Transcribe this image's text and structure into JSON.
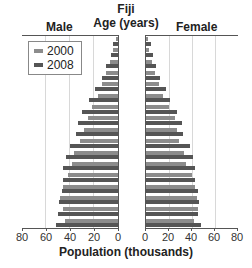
{
  "chart_data": {
    "type": "bar",
    "subtype": "population-pyramid",
    "title": "Fiji",
    "subtitle": "Age (years)",
    "left_label": "Male",
    "right_label": "Female",
    "xlabel": "Population (thousands)",
    "ylabel": "Age (years)",
    "xlim": [
      0,
      80
    ],
    "x_ticks_left": [
      "80",
      "60",
      "40",
      "20",
      "0"
    ],
    "x_ticks_right": [
      "0",
      "20",
      "40",
      "60",
      "80"
    ],
    "grid": true,
    "legend_position": "upper-left",
    "categories": [
      "0-4",
      "5-9",
      "10-14",
      "15-19",
      "20-24",
      "25-29",
      "30-34",
      "35-39",
      "40-44",
      "45-49",
      "50-54",
      "55-59",
      "60-64",
      "65-69",
      "70-74",
      "75-79",
      "80+"
    ],
    "series": [
      {
        "name": "2000",
        "side": "male",
        "color": "#8c8c8c",
        "values": [
          44,
          46,
          48,
          46,
          42,
          38,
          37,
          32,
          28,
          25,
          22,
          17,
          13,
          10,
          7,
          4,
          2
        ]
      },
      {
        "name": "2008",
        "side": "male",
        "color": "#555555",
        "values": [
          52,
          50,
          49,
          47,
          46,
          46,
          43,
          40,
          35,
          33,
          30,
          24,
          19,
          13,
          10,
          6,
          4
        ]
      },
      {
        "name": "2000",
        "side": "female",
        "color": "#8c8c8c",
        "values": [
          42,
          45,
          44,
          43,
          40,
          35,
          33,
          29,
          27,
          25,
          20,
          15,
          11,
          8,
          5,
          3,
          2
        ]
      },
      {
        "name": "2008",
        "side": "female",
        "color": "#555555",
        "values": [
          48,
          45,
          46,
          45,
          43,
          43,
          41,
          38,
          32,
          31,
          27,
          21,
          17,
          12,
          9,
          6,
          4
        ]
      }
    ]
  },
  "legend": [
    {
      "label": "2000",
      "color": "#8c8c8c"
    },
    {
      "label": "2008",
      "color": "#555555"
    }
  ]
}
